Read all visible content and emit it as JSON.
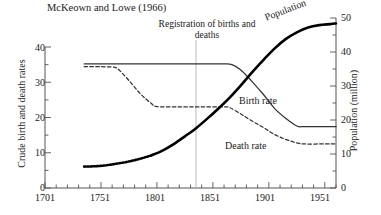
{
  "title": "McKeown and Lowe (1966)",
  "annotation": "Registration of births and deaths",
  "axes": {
    "left": {
      "label": "Crude birth and death rates",
      "ticks": [
        "0",
        "10",
        "20",
        "30",
        "40"
      ],
      "min": 0,
      "max": 40
    },
    "right": {
      "label": "Population (million)",
      "ticks": [
        "0",
        "10",
        "20",
        "30",
        "40",
        "50"
      ],
      "min": 0,
      "max": 50
    },
    "bottom": {
      "ticks": [
        "1701",
        "1751",
        "1801",
        "1851",
        "1901",
        "1951"
      ],
      "min": 1701,
      "max": 1961
    }
  },
  "series_labels": {
    "birth": "Birth rate",
    "death": "Death rate",
    "population": "Population"
  },
  "chart_data": {
    "type": "line",
    "title": "McKeown and Lowe (1966)",
    "xlabel": "",
    "ylabel": "Crude birth and death rates",
    "y2label": "Population (million)",
    "xlim": [
      1701,
      1961
    ],
    "ylim": [
      0,
      40
    ],
    "y2lim": [
      0,
      50
    ],
    "grid": false,
    "legend": "inline-annotations",
    "annotations": [
      {
        "text": "Registration of births and deaths",
        "x": 1838,
        "type": "vertical-reference-line"
      }
    ],
    "series": [
      {
        "name": "Birth rate",
        "axis": "left",
        "style": "solid",
        "color": "#333333",
        "points": [
          [
            1736,
            35.2
          ],
          [
            1751,
            35.2
          ],
          [
            1771,
            35.2
          ],
          [
            1791,
            35.2
          ],
          [
            1811,
            35.2
          ],
          [
            1831,
            35.2
          ],
          [
            1851,
            35.2
          ],
          [
            1861,
            35.2
          ],
          [
            1868,
            35.0
          ],
          [
            1876,
            33.5
          ],
          [
            1886,
            30.2
          ],
          [
            1896,
            26.6
          ],
          [
            1906,
            22.6
          ],
          [
            1916,
            19.8
          ],
          [
            1926,
            17.6
          ],
          [
            1933,
            17.4
          ],
          [
            1951,
            17.4
          ],
          [
            1961,
            17.4
          ]
        ]
      },
      {
        "name": "Death rate",
        "axis": "left",
        "style": "dashed",
        "color": "#333333",
        "points": [
          [
            1736,
            34.4
          ],
          [
            1751,
            34.4
          ],
          [
            1761,
            34.3
          ],
          [
            1766,
            33.8
          ],
          [
            1776,
            30.5
          ],
          [
            1786,
            26.8
          ],
          [
            1796,
            24.0
          ],
          [
            1801,
            23.1
          ],
          [
            1821,
            23.0
          ],
          [
            1841,
            23.0
          ],
          [
            1861,
            23.0
          ],
          [
            1866,
            22.8
          ],
          [
            1876,
            21.0
          ],
          [
            1886,
            19.0
          ],
          [
            1896,
            17.2
          ],
          [
            1906,
            15.2
          ],
          [
            1916,
            13.8
          ],
          [
            1926,
            12.8
          ],
          [
            1933,
            12.5
          ],
          [
            1951,
            12.5
          ],
          [
            1961,
            12.5
          ]
        ]
      },
      {
        "name": "Population",
        "axis": "right",
        "style": "thick-solid-with-dotted-estimate",
        "color": "#000000",
        "dotted_until": 1791,
        "points": [
          [
            1736,
            6.3
          ],
          [
            1746,
            6.4
          ],
          [
            1756,
            6.7
          ],
          [
            1766,
            7.2
          ],
          [
            1776,
            7.8
          ],
          [
            1786,
            8.6
          ],
          [
            1796,
            9.6
          ],
          [
            1806,
            11.0
          ],
          [
            1816,
            12.9
          ],
          [
            1826,
            15.2
          ],
          [
            1836,
            17.6
          ],
          [
            1846,
            20.4
          ],
          [
            1856,
            23.4
          ],
          [
            1866,
            26.6
          ],
          [
            1876,
            30.2
          ],
          [
            1886,
            34.0
          ],
          [
            1896,
            37.6
          ],
          [
            1906,
            41.0
          ],
          [
            1916,
            43.8
          ],
          [
            1926,
            45.8
          ],
          [
            1936,
            47.2
          ],
          [
            1946,
            47.9
          ],
          [
            1956,
            48.2
          ],
          [
            1961,
            48.4
          ]
        ]
      }
    ]
  }
}
